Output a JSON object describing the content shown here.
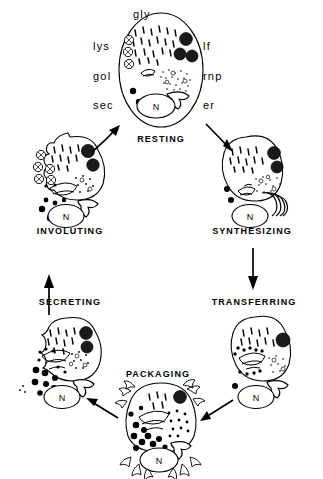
{
  "figure": {
    "background_color": "#ffffff",
    "ink_color": "#000000"
  },
  "organelle_labels": [
    {
      "id": "gly",
      "text": "gly",
      "meaning": "glycogen",
      "x": 148,
      "y": 8,
      "align": "center"
    },
    {
      "id": "lys",
      "text": "lys",
      "meaning": "lysosome",
      "x": 93,
      "y": 40,
      "align": "left"
    },
    {
      "id": "lf",
      "text": "lf",
      "meaning": "lipofuscin",
      "x": 203,
      "y": 40,
      "align": "left"
    },
    {
      "id": "gol",
      "text": "gol",
      "meaning": "golgi",
      "x": 93,
      "y": 70,
      "align": "left"
    },
    {
      "id": "rnp",
      "text": "rnp",
      "meaning": "ribonucleoprotein",
      "x": 203,
      "y": 70,
      "align": "left"
    },
    {
      "id": "sec",
      "text": "sec",
      "meaning": "secretory granule",
      "x": 93,
      "y": 99,
      "align": "left"
    },
    {
      "id": "er",
      "text": "er",
      "meaning": "endoplasmic reticulum",
      "x": 203,
      "y": 99,
      "align": "left"
    }
  ],
  "stages": [
    {
      "id": "resting",
      "label": "RESTING",
      "label_x": 161,
      "label_y": 140,
      "cell_cx": 161,
      "cell_cy": 70,
      "nucleus_label": "N"
    },
    {
      "id": "synthesizing",
      "label": "SYNTHESIZING",
      "label_x": 252,
      "label_y": 231,
      "cell_cx": 252,
      "cell_cy": 183,
      "nucleus_label": "N"
    },
    {
      "id": "transferring",
      "label": "TRANSFERRING",
      "label_x": 254,
      "label_y": 302,
      "cell_cx": 259,
      "cell_cy": 364,
      "nucleus_label": "N"
    },
    {
      "id": "packaging",
      "label": "PACKAGING",
      "label_x": 158,
      "label_y": 374,
      "cell_cx": 161,
      "cell_cy": 427,
      "nucleus_label": "N"
    },
    {
      "id": "secreting",
      "label": "SECRETING",
      "label_x": 70,
      "label_y": 302,
      "cell_cx": 64,
      "cell_cy": 364,
      "nucleus_label": "N"
    },
    {
      "id": "involuting",
      "label": "INVOLUTING",
      "label_x": 70,
      "label_y": 231,
      "cell_cx": 68,
      "cell_cy": 183,
      "nucleus_label": "N"
    }
  ],
  "transitions": [
    {
      "id": "involuting-to-resting",
      "from": "involuting",
      "to": "resting",
      "direction": "up-right"
    },
    {
      "id": "resting-to-synthesizing",
      "from": "resting",
      "to": "synthesizing",
      "direction": "down-right"
    },
    {
      "id": "synthesizing-to-transferring",
      "from": "synthesizing",
      "to": "transferring",
      "direction": "down"
    },
    {
      "id": "transferring-to-packaging",
      "from": "transferring",
      "to": "packaging",
      "direction": "down-left"
    },
    {
      "id": "packaging-to-secreting",
      "from": "packaging",
      "to": "secreting",
      "direction": "up-left"
    },
    {
      "id": "secreting-to-involuting",
      "from": "secreting",
      "to": "involuting",
      "direction": "up"
    }
  ]
}
